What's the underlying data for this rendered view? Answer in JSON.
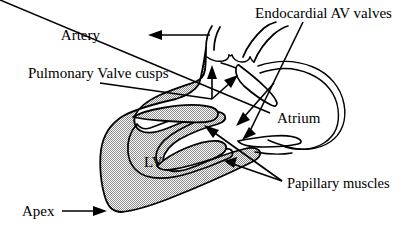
{
  "figure": {
    "background_color": "#ffffff",
    "line_color": "#000000",
    "myocardium_fill": "#c8c8c8"
  },
  "labels": {
    "artery": "Artery",
    "pulmonary_valve_cusps": "Pulmonary Valve cusps",
    "endocardial_av_valves": "Endocardial AV valves",
    "atrium": "Atrium",
    "lv": "LV",
    "papillary_muscles": "Papillary muscles",
    "apex": "Apex"
  },
  "annotations": [
    {
      "id": "artery",
      "label": "Artery",
      "pointer": "arrow-left",
      "target": "great artery / outflow vessel at top"
    },
    {
      "id": "pulmonary-valve-cusps",
      "label": "Pulmonary Valve cusps",
      "pointer": "leader-with-two-arrows-up",
      "target": "semilunar valve cusps in outflow tract"
    },
    {
      "id": "endocardial-av-valves",
      "label": "Endocardial AV valves",
      "pointer": "leader-with-two-arrows-left",
      "target": "atrioventricular valve leaflets"
    },
    {
      "id": "atrium",
      "label": "Atrium",
      "pointer": "none",
      "target": "atrial chamber"
    },
    {
      "id": "lv",
      "label": "LV",
      "pointer": "none",
      "target": "left ventricular cavity"
    },
    {
      "id": "papillary-muscles",
      "label": "Papillary muscles",
      "pointer": "two-leaders-up-left",
      "target": "papillary muscle projections in LV"
    },
    {
      "id": "apex",
      "label": "Apex",
      "pointer": "arrow-right",
      "target": "ventricular apex at lower left"
    }
  ]
}
